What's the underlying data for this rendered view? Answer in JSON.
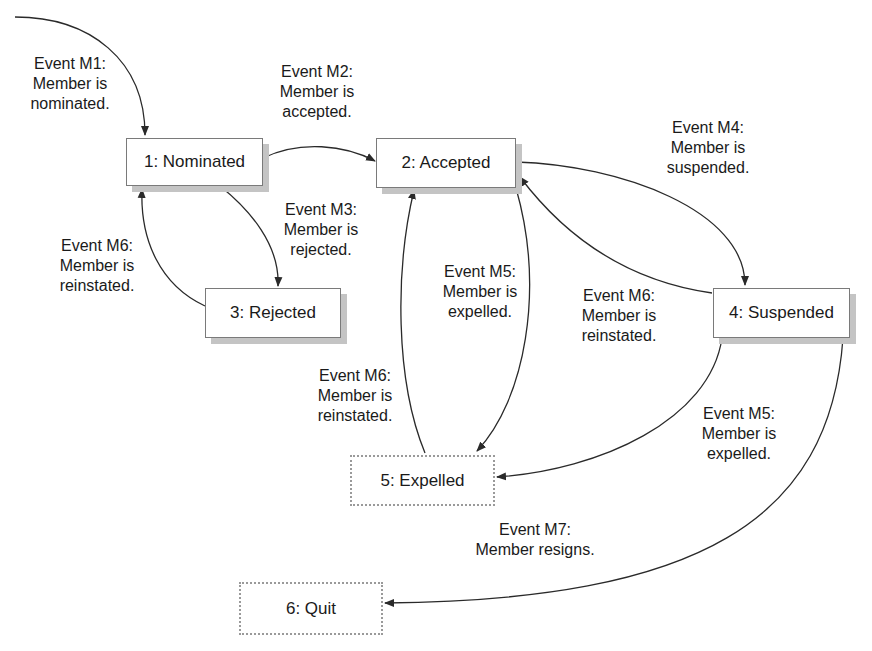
{
  "diagram": {
    "type": "state-transition"
  },
  "states": [
    {
      "id": "s1",
      "label": "1: Nominated",
      "style": "solid"
    },
    {
      "id": "s2",
      "label": "2: Accepted",
      "style": "solid"
    },
    {
      "id": "s3",
      "label": "3: Rejected",
      "style": "solid"
    },
    {
      "id": "s4",
      "label": "4: Suspended",
      "style": "solid"
    },
    {
      "id": "s5",
      "label": "5: Expelled",
      "style": "dotted"
    },
    {
      "id": "s6",
      "label": "6: Quit",
      "style": "dotted"
    }
  ],
  "transitions": [
    {
      "from": "start",
      "to": "s1",
      "line1": "Event M1:",
      "line2": "Member is",
      "line3": "nominated."
    },
    {
      "from": "s1",
      "to": "s2",
      "line1": "Event M2:",
      "line2": "Member is",
      "line3": "accepted."
    },
    {
      "from": "s1",
      "to": "s3",
      "line1": "Event M3:",
      "line2": "Member is",
      "line3": "rejected."
    },
    {
      "from": "s3",
      "to": "s1",
      "line1": "Event M6:",
      "line2": "Member is",
      "line3": "reinstated."
    },
    {
      "from": "s2",
      "to": "s4",
      "line1": "Event M4:",
      "line2": "Member is",
      "line3": "suspended."
    },
    {
      "from": "s4",
      "to": "s2",
      "line1": "Event M6:",
      "line2": "Member is",
      "line3": "reinstated."
    },
    {
      "from": "s2",
      "to": "s5",
      "line1": "Event M5:",
      "line2": "Member is",
      "line3": "expelled."
    },
    {
      "from": "s5",
      "to": "s2",
      "line1": "Event M6:",
      "line2": "Member is",
      "line3": "reinstated."
    },
    {
      "from": "s4",
      "to": "s5",
      "line1": "Event M5:",
      "line2": "Member is",
      "line3": "expelled."
    },
    {
      "from": "s4",
      "to": "s6",
      "line1": "Event M7:",
      "line2": "Member resigns.",
      "line3": ""
    }
  ],
  "colors": {
    "line": "#2a2a2a",
    "box_border": "#7a7a7a",
    "shadow": "#c4c4c4",
    "dotted_border": "#9a9a9a"
  }
}
